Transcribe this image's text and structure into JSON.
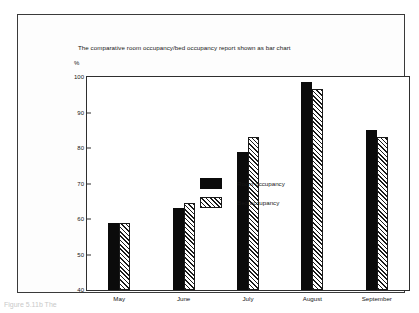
{
  "figure": {
    "caption_fragment": "Figure 5.11b  The"
  },
  "chart_data": {
    "type": "bar",
    "title": "The comparative room occupancy/bed occupancy report shown as bar chart",
    "xlabel": "",
    "ylabel": "%",
    "ylim": [
      40,
      100
    ],
    "yticks": [
      100,
      90,
      80,
      70,
      60,
      50,
      40
    ],
    "grid": false,
    "legend_position": "inside-upper-left",
    "categories": [
      "May",
      "June",
      "July",
      "August",
      "September"
    ],
    "series": [
      {
        "name": "Room occupancy",
        "fill": "solid-black",
        "values": [
          59,
          63,
          79,
          98.5,
          85
        ]
      },
      {
        "name": "Bed occupancy",
        "fill": "diagonal-hatch",
        "values": [
          59,
          64.5,
          83,
          96.5,
          83
        ]
      }
    ]
  }
}
